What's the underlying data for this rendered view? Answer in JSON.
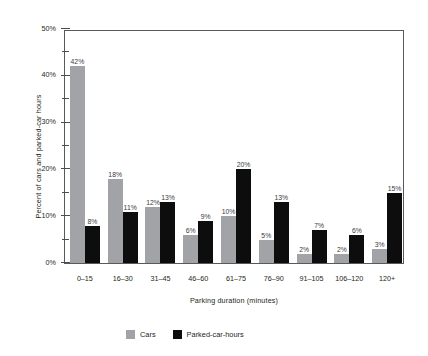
{
  "chart_data": {
    "type": "bar",
    "title": "",
    "xlabel": "Parking duration (minutes)",
    "ylabel": "Percent of cars and parked-car hours",
    "categories": [
      "0–15",
      "16–30",
      "31–45",
      "46–60",
      "61–75",
      "76–90",
      "91–105",
      "106–120",
      "120+"
    ],
    "series": [
      {
        "name": "Cars",
        "color": "#a1a3a6",
        "values": [
          42,
          18,
          12,
          6,
          10,
          5,
          2,
          2,
          3
        ],
        "labels": [
          "42%",
          "18%",
          "12%",
          "6%",
          "10%",
          "5%",
          "2%",
          "2%",
          "3%"
        ]
      },
      {
        "name": "Parked-car-hours",
        "color": "#0d0d0d",
        "values": [
          8,
          11,
          13,
          9,
          20,
          13,
          7,
          6,
          15
        ],
        "labels": [
          "8%",
          "11%",
          "13%",
          "9%",
          "20%",
          "13%",
          "7%",
          "6%",
          "15%"
        ]
      }
    ],
    "ylim": [
      0,
      50
    ],
    "y_major_ticks": [
      0,
      10,
      20,
      30,
      40,
      50
    ],
    "y_major_tick_labels": [
      "0%",
      "10%",
      "20%",
      "30%",
      "40%",
      "50%"
    ],
    "y_minor_ticks": [
      5,
      15,
      25,
      35,
      45
    ],
    "grid": false,
    "legend_position": "bottom-left",
    "value_unit": "%"
  }
}
